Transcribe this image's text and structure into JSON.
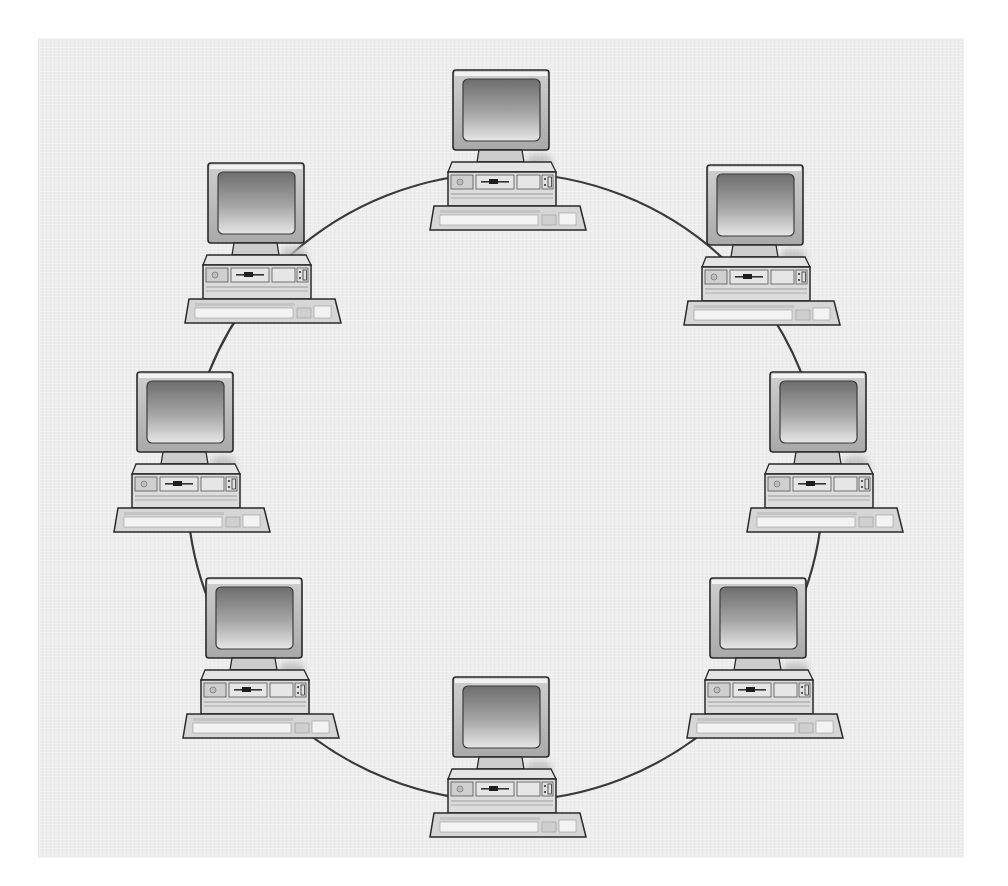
{
  "diagram": {
    "topology": "ring",
    "node_type": "desktop computer (monitor, system unit, keyboard)",
    "node_count": 8,
    "nodes": [
      {
        "id": "pc-top",
        "position": "top"
      },
      {
        "id": "pc-upper-right",
        "position": "upper-right"
      },
      {
        "id": "pc-right",
        "position": "right"
      },
      {
        "id": "pc-lower-right",
        "position": "lower-right"
      },
      {
        "id": "pc-bottom",
        "position": "bottom"
      },
      {
        "id": "pc-lower-left",
        "position": "lower-left"
      },
      {
        "id": "pc-left",
        "position": "left"
      },
      {
        "id": "pc-upper-left",
        "position": "upper-left"
      }
    ],
    "links": [
      [
        "pc-top",
        "pc-upper-right"
      ],
      [
        "pc-upper-right",
        "pc-right"
      ],
      [
        "pc-right",
        "pc-lower-right"
      ],
      [
        "pc-lower-right",
        "pc-bottom"
      ],
      [
        "pc-bottom",
        "pc-lower-left"
      ],
      [
        "pc-lower-left",
        "pc-left"
      ],
      [
        "pc-left",
        "pc-upper-left"
      ],
      [
        "pc-upper-left",
        "pc-top"
      ]
    ]
  },
  "colors": {
    "panel_background": "#ededed",
    "page_background": "#ffffff",
    "ring_line": "#3a3a3a",
    "outline": "#2a2a2a",
    "bezel": "#b8b8b8",
    "screen_dark": "#6e6e6e",
    "screen_light": "#e6e6e6",
    "case": "#dcdcdc",
    "keyboard": "#d6d6d6",
    "shadow": "#bdbdbd"
  }
}
